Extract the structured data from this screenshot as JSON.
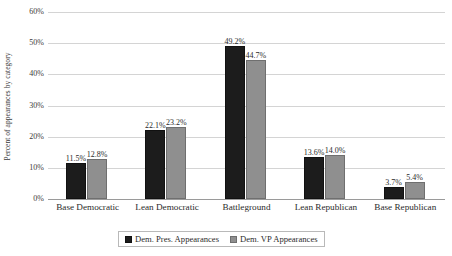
{
  "chart_data": {
    "type": "bar",
    "title": "",
    "xlabel": "",
    "ylabel": "Percent of appearances by category",
    "ylim": [
      0,
      60
    ],
    "ytick_labels": [
      "0%",
      "10%",
      "20%",
      "30%",
      "40%",
      "50%",
      "60%"
    ],
    "ytick_values": [
      0,
      10,
      20,
      30,
      40,
      50,
      60
    ],
    "grid": true,
    "legend_position": "bottom",
    "categories": [
      "Base Democratic",
      "Lean Democratic",
      "Battleground",
      "Lean Republican",
      "Base Republican"
    ],
    "series": [
      {
        "name": "Dem. Pres. Appearances",
        "color": "#1c1c1c",
        "values": [
          11.5,
          22.1,
          49.2,
          13.6,
          3.7
        ],
        "labels": [
          "11.5%",
          "22.1%",
          "49.2%",
          "13.6%",
          "3.7%"
        ]
      },
      {
        "name": "Dem. VP Appearances",
        "color": "#8f8f8f",
        "values": [
          12.8,
          23.2,
          44.7,
          14.0,
          5.4
        ],
        "labels": [
          "12.8%",
          "23.2%",
          "44.7%",
          "14.0%",
          "5.4%"
        ]
      }
    ]
  },
  "colors": {
    "background": "#ffffff",
    "gridline": "#d4d4d4",
    "axis": "#9a9a9a",
    "text": "#2b2b2b",
    "series_0": "#1c1c1c",
    "series_1": "#8f8f8f"
  }
}
